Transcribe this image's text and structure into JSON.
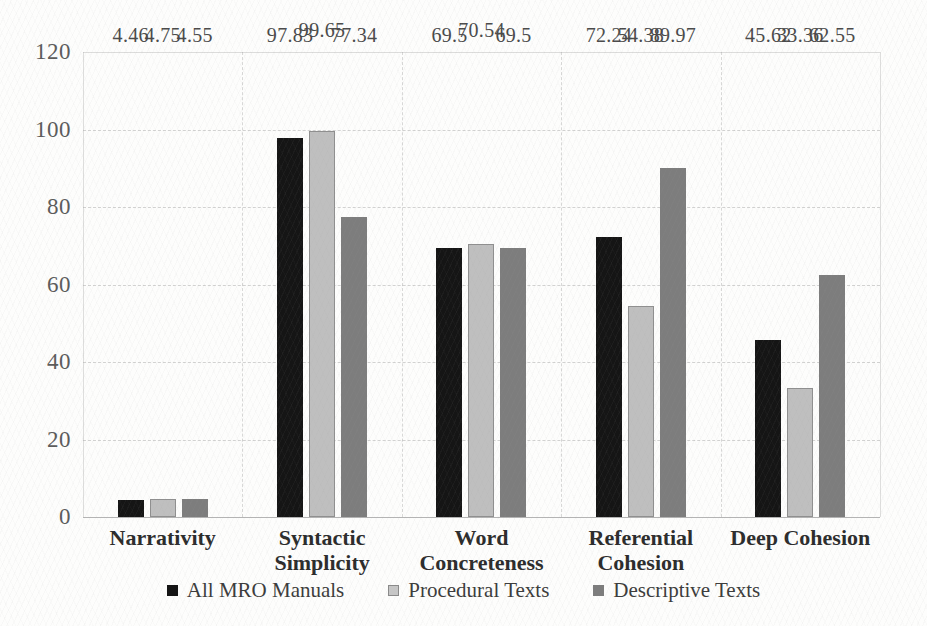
{
  "chart_data": {
    "type": "bar",
    "title": "",
    "subtitle": "",
    "xlabel": "",
    "ylabel": "",
    "ylim": [
      0,
      120
    ],
    "yticks": [
      0,
      20,
      40,
      60,
      80,
      100,
      120
    ],
    "ytick_labels": [
      "0",
      "20",
      "40",
      "60",
      "80",
      "100",
      "120"
    ],
    "grid": "horizontal-dashed-and-vertical-category-separators",
    "legend_position": "bottom-center",
    "categories": [
      "Narrativity",
      "Syntactic Simplicity",
      "Word Concreteness",
      "Referential Cohesion",
      "Deep Cohesion"
    ],
    "category_lines": [
      [
        "Narrativity"
      ],
      [
        "Syntactic",
        "Simplicity"
      ],
      [
        "Word",
        "Concreteness"
      ],
      [
        "Referential",
        "Cohesion"
      ],
      [
        "Deep Cohesion"
      ]
    ],
    "series": [
      {
        "name": "All MRO Manuals",
        "color": "#151515",
        "values": [
          4.46,
          97.83,
          69.5,
          72.24,
          45.62
        ],
        "labels": [
          "4.46",
          "97.83",
          "69.5",
          "72.24",
          "45.62"
        ]
      },
      {
        "name": "Procedural Texts",
        "color": "#bfbfbf",
        "values": [
          4.75,
          99.65,
          70.54,
          54.38,
          33.36
        ],
        "labels": [
          "4.75",
          "99.65",
          "70.54",
          "54.38",
          "33.36"
        ]
      },
      {
        "name": "Descriptive Texts",
        "color": "#7d7d7d",
        "values": [
          4.55,
          77.34,
          69.5,
          89.97,
          62.55
        ],
        "labels": [
          "4.55",
          "77.34",
          "69.5",
          "89.97",
          "62.55"
        ]
      }
    ]
  },
  "legend": {
    "items": [
      {
        "label": "All MRO Manuals",
        "swatch": "series-0-swatch"
      },
      {
        "label": "Procedural Texts",
        "swatch": "series-1-swatch"
      },
      {
        "label": "Descriptive Texts",
        "swatch": "series-2-swatch"
      }
    ]
  }
}
